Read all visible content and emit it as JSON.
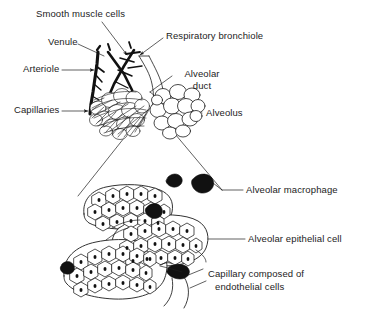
{
  "figure": {
    "background_color": "#ffffff",
    "ink_color": "#1c1c1c",
    "width": 377,
    "height": 319
  },
  "labels": {
    "smooth_muscle_cells": "Smooth muscle cells",
    "venule": "Venule",
    "respiratory_bronchiole": "Respiratory bronchiole",
    "arteriole": "Arteriole",
    "alveolar_duct_line1": "Alveolar",
    "alveolar_duct_line2": "duct",
    "capillaries": "Capillaries",
    "alveolus": "Alveolus",
    "alveolar_macrophage": "Alveolar macrophage",
    "alveolar_epithelial_cell": "Alveolar epithelial cell",
    "capillary_line1": "Capillary composed of",
    "capillary_line2": "endothelial cells"
  },
  "panels": {
    "upper": {
      "name": "alveolar-sac-overview",
      "description": "Terminal respiratory unit showing arteriole, venule, smooth muscle, respiratory bronchiole, alveolar duct, capillary-covered alveoli and open alveoli"
    },
    "lower": {
      "name": "alveolar-wall-magnified",
      "description": "Magnified view of alveolar walls built from polygonal epithelial cells with nuclei, dark macrophages and a capillary"
    }
  }
}
